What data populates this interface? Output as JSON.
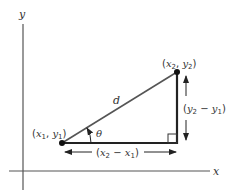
{
  "diagram": {
    "axes": {
      "x_label": "x",
      "y_label": "y"
    },
    "points": {
      "p1": {
        "label_open": "(",
        "x": "x",
        "x_sub": "1",
        "sep": ", ",
        "y": "y",
        "y_sub": "1",
        "label_close": ")"
      },
      "p2": {
        "label_open": "(",
        "x": "x",
        "x_sub": "2",
        "sep": ", ",
        "y": "y",
        "y_sub": "2",
        "label_close": ")"
      }
    },
    "hypotenuse_label": "d",
    "angle_label": "θ",
    "horizontal_diff": {
      "open": "(",
      "a": "x",
      "a_sub": "2",
      "minus": " − ",
      "b": "x",
      "b_sub": "1",
      "close": ")"
    },
    "vertical_diff": {
      "open": "(",
      "a": "y",
      "a_sub": "2",
      "minus": " − ",
      "b": "y",
      "b_sub": "1",
      "close": ")"
    },
    "colors": {
      "line": "#333333",
      "axis": "#555555",
      "hypotenuse": "#555555"
    }
  }
}
